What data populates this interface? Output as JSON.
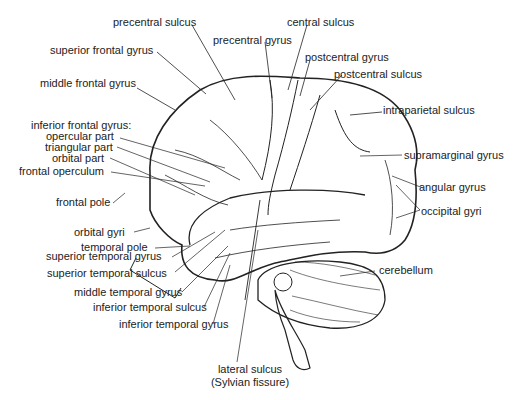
{
  "diagram": {
    "labels": {
      "precentral_sulcus": "precentral sulcus",
      "central_sulcus": "central sulcus",
      "superior_frontal_gyrus": "superior frontal gyrus",
      "precentral_gyrus": "precentral gyrus",
      "postcentral_gyrus": "postcentral gyrus",
      "postcentral_sulcus": "postcentral sulcus",
      "middle_frontal_gyrus": "middle frontal gyrus",
      "intraparietal_sulcus": "intraparietal sulcus",
      "inferior_frontal_gyrus": "inferior frontal gyrus:",
      "opercular_part": "opercular part",
      "triangular_part": "triangular part",
      "orbital_part": "orbital part",
      "frontal_operculum": "frontal operculum",
      "supramarginal_gyrus": "supramarginal gyrus",
      "frontal_pole": "frontal pole",
      "angular_gyrus": "angular gyrus",
      "orbital_gyri": "orbital gyri",
      "occipital_gyri": "occipital gyri",
      "temporal_pole": "temporal pole",
      "superior_temporal_gyrus": "superior temporal gyrus",
      "superior_temporal_sulcus": "superior temporal sulcus",
      "cerebellum": "cerebellum",
      "middle_temporal_gyrus": "middle temporal gyrus",
      "inferior_temporal_sulcus": "inferior temporal sulcus",
      "inferior_temporal_gyrus": "inferior temporal gyrus",
      "lateral_sulcus": "lateral sulcus",
      "sylvian_fissure": "(Sylvian fissure)"
    }
  }
}
